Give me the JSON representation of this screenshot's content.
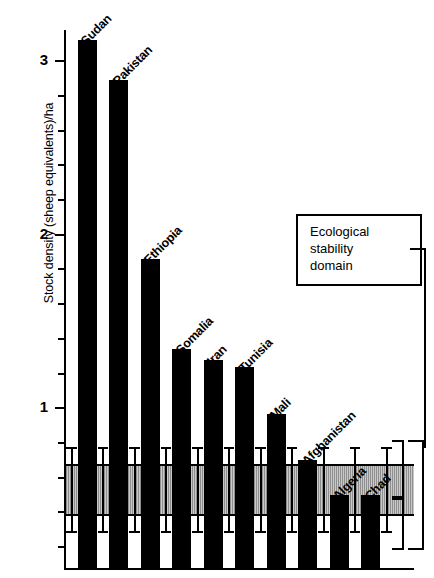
{
  "chart_data": {
    "type": "bar",
    "title": "",
    "xlabel": "",
    "ylabel": "Stock density (sheep equivalents)/ha",
    "ylim": [
      0.08,
      3.18
    ],
    "ytick_labels": [
      "1",
      "2",
      "3"
    ],
    "ytick_values": [
      1,
      2,
      3
    ],
    "minor_tick_interval": 0.2,
    "grid": false,
    "categories": [
      "Sudan",
      "Pakistan",
      "Ethiopia",
      "Somalia",
      "Iran",
      "Tunisia",
      "Mali",
      "Afghanistan",
      "Algeria",
      "Chad"
    ],
    "values": [
      3.12,
      2.89,
      1.86,
      1.34,
      1.28,
      1.24,
      0.97,
      0.7,
      0.5,
      0.5
    ],
    "series": [
      {
        "name": "Stock density",
        "values": [
          3.12,
          2.89,
          1.86,
          1.34,
          1.28,
          1.24,
          0.97,
          0.7,
          0.5,
          0.5
        ]
      }
    ],
    "annotations": [
      {
        "name": "ecological-stability-domain",
        "text": "Ecological stability domain",
        "type": "shaded-band",
        "y_range": [
          0.38,
          0.68
        ]
      }
    ],
    "error_bars": {
      "description": "vertical error bars spanning the ecological stability domain for each country",
      "upper": 0.78,
      "lower": 0.28
    },
    "legend_position": "inside-right"
  },
  "axis": {
    "ylabel": "Stock density (sheep equivalents)/ha",
    "ticks": [
      {
        "label": "3",
        "value": 3
      },
      {
        "label": "2",
        "value": 2
      },
      {
        "label": "1",
        "value": 1
      }
    ]
  },
  "legend": {
    "line1": "Ecological",
    "line2": "stability",
    "line3": "domain"
  },
  "bars": [
    {
      "label": "Sudan",
      "value": 3.12
    },
    {
      "label": "Pakistan",
      "value": 2.89
    },
    {
      "label": "Ethiopia",
      "value": 1.86
    },
    {
      "label": "Somalia",
      "value": 1.34
    },
    {
      "label": "Iran",
      "value": 1.28
    },
    {
      "label": "Tunisia",
      "value": 1.24
    },
    {
      "label": "Mali",
      "value": 0.97
    },
    {
      "label": "Afghanistan",
      "value": 0.7
    },
    {
      "label": "Algeria",
      "value": 0.5
    },
    {
      "label": "Chad",
      "value": 0.5
    }
  ],
  "colors": {
    "ink": "#000000",
    "band": "#b0b0b0",
    "background": "#ffffff"
  }
}
